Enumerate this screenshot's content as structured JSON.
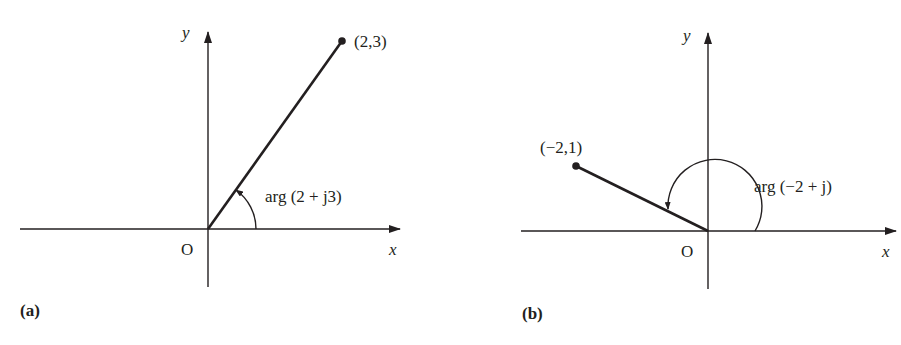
{
  "figure": {
    "panels": [
      {
        "id": "a",
        "caption": "(a)",
        "axis_x_label": "x",
        "axis_y_label": "y",
        "origin_label": "O",
        "point": {
          "x": 2,
          "y": 3,
          "label": "(2,3)"
        },
        "angle_label": "arg (2 + j3)"
      },
      {
        "id": "b",
        "caption": "(b)",
        "axis_x_label": "x",
        "axis_y_label": "y",
        "origin_label": "O",
        "point": {
          "x": -2,
          "y": 1,
          "label": "(−2,1)"
        },
        "angle_label": "arg (−2 + j)"
      }
    ],
    "colors": {
      "ink": "#231f20",
      "background": "#ffffff"
    }
  }
}
